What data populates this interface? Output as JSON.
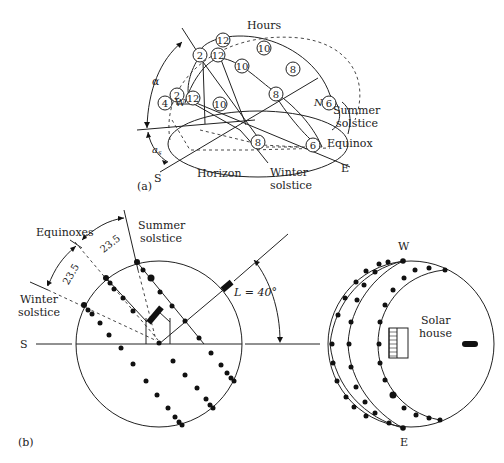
{
  "figure_a": {
    "panel_label": "(a)",
    "title_label": "Hours",
    "alpha_label": "α",
    "as_label": "a",
    "as_sub": "s",
    "labels": {
      "north": "N",
      "south": "S",
      "east": "E",
      "west": "W",
      "horizon": "Horizon",
      "summer_solstice_1": "Summer",
      "summer_solstice_2": "solstice",
      "equinox": "Equinox",
      "winter_solstice_1": "Winter",
      "winter_solstice_2": "solstice"
    },
    "hour_markers": [
      {
        "text": "12",
        "path": "summer"
      },
      {
        "text": "10",
        "path": "summer"
      },
      {
        "text": "8",
        "path": "summer"
      },
      {
        "text": "6",
        "path": "summer"
      },
      {
        "text": "2",
        "path": "summer"
      },
      {
        "text": "12",
        "path": "equinox"
      },
      {
        "text": "10",
        "path": "equinox"
      },
      {
        "text": "8",
        "path": "equinox"
      },
      {
        "text": "6",
        "path": "equinox"
      },
      {
        "text": "2",
        "path": "equinox"
      },
      {
        "text": "4",
        "path": "equinox"
      },
      {
        "text": "12",
        "path": "winter"
      },
      {
        "text": "10",
        "path": "winter"
      },
      {
        "text": "8",
        "path": "winter"
      }
    ]
  },
  "figure_b": {
    "panel_label": "(b)",
    "labels": {
      "equinoxes": "Equinoxes",
      "summer_solstice_1": "Summer",
      "summer_solstice_2": "solstice",
      "winter_solstice_1": "Winter",
      "winter_solstice_2": "solstice",
      "angle_upper": "23.5",
      "angle_lower": "23.5",
      "latitude": "L = 40°",
      "south": "S",
      "west": "W",
      "east": "E",
      "solar_house_1": "Solar",
      "solar_house_2": "house"
    }
  }
}
